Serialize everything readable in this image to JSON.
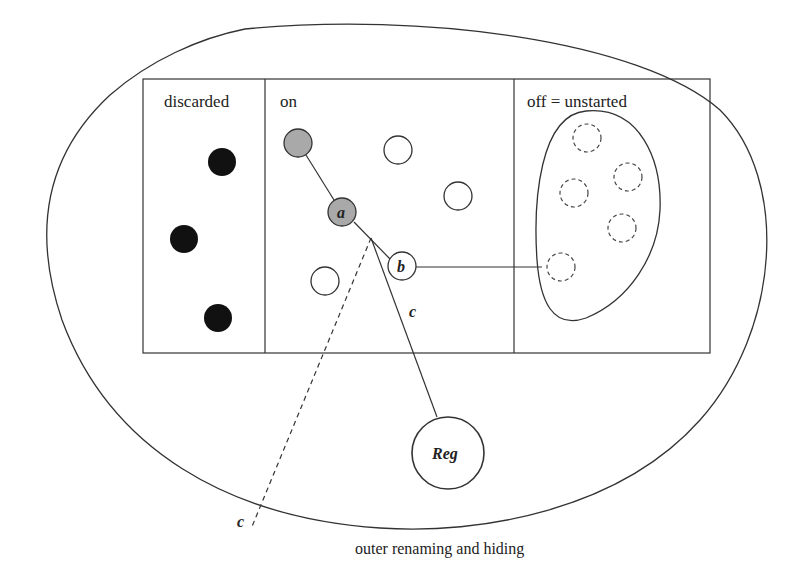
{
  "diagram": {
    "caption": "outer renaming and hiding",
    "columns": [
      {
        "id": "discarded",
        "label": "discarded"
      },
      {
        "id": "on",
        "label": "on"
      },
      {
        "id": "off",
        "label": "off = unstarted"
      }
    ],
    "nodes": {
      "a": {
        "label": "a",
        "fill": "#a9a9a9"
      },
      "b": {
        "label": "b",
        "fill": "#ffffff"
      },
      "reg": {
        "label": "Reg",
        "fill": "#ffffff"
      }
    },
    "edge_labels": {
      "c_solid": "c",
      "c_dashed": "c"
    },
    "colors": {
      "stroke": "#333333",
      "discarded_fill": "#111111",
      "active_fill": "#a9a9a9"
    }
  }
}
